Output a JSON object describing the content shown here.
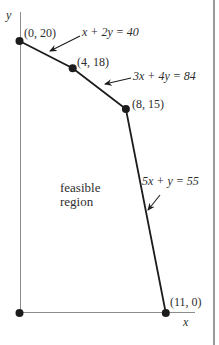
{
  "figure": {
    "region_label_line1": "feasible",
    "region_label_line2": "region",
    "colors": {
      "boundary": "#1c1c1c",
      "axis": "#8c8c8c",
      "text": "#2e2e2e",
      "border": "#9a9a9a",
      "background": "#ffffff"
    }
  },
  "chart_data": {
    "type": "line",
    "xlabel": "x",
    "ylabel": "y",
    "xlim": [
      0,
      14.7
    ],
    "ylim": [
      0,
      22.2
    ],
    "grid": false,
    "vertices": [
      {
        "x": 0,
        "y": 20,
        "label": "(0, 20)"
      },
      {
        "x": 4,
        "y": 18,
        "label": "(4, 18)"
      },
      {
        "x": 8,
        "y": 15,
        "label": "(8, 15)"
      },
      {
        "x": 11,
        "y": 0,
        "label": "(11, 0)"
      }
    ],
    "origin": {
      "x": 0,
      "y": 0
    },
    "constraints": [
      {
        "equation": "x + 2y = 40",
        "segment": [
          [
            0,
            20
          ],
          [
            4,
            18
          ]
        ]
      },
      {
        "equation": "3x + 4y = 84",
        "segment": [
          [
            4,
            18
          ],
          [
            8,
            15
          ]
        ]
      },
      {
        "equation": "5x + y = 55",
        "segment": [
          [
            8,
            15
          ],
          [
            11,
            0
          ]
        ]
      }
    ],
    "region_label": "feasible region"
  }
}
